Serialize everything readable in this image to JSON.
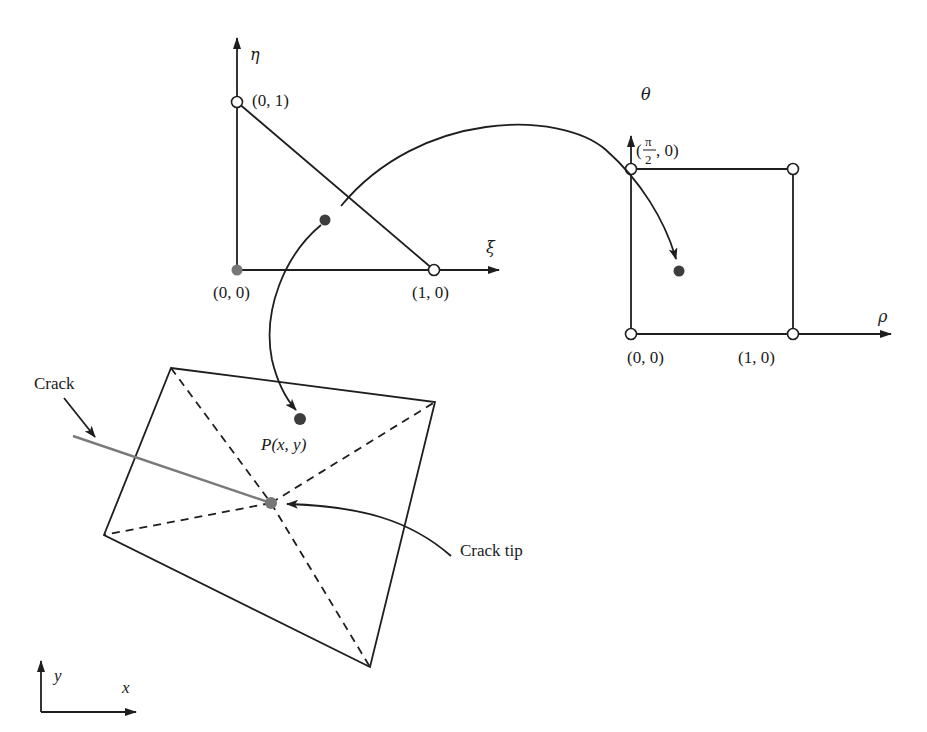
{
  "figure": {
    "type": "isoparametric mapping diagram for crack-tip element",
    "colors": {
      "line": "#1e1e1e",
      "crack": "#7a7a7a",
      "filled_point": "#3d3d3d",
      "crack_tip_point": "#777777",
      "background": "#ffffff"
    }
  },
  "triangle_domain": {
    "axis_vertical_label": "η",
    "axis_horizontal_label": "ξ",
    "vertices": [
      {
        "label": "(0, 0)",
        "style": "filled-gray"
      },
      {
        "label": "(1, 0)",
        "style": "open"
      },
      {
        "label": "(0, 1)",
        "style": "open"
      }
    ]
  },
  "square_domain": {
    "axis_vertical_label": "θ",
    "axis_horizontal_label": "ρ",
    "vertices": [
      {
        "label": "(0, 0)",
        "style": "open"
      },
      {
        "label": "(1, 0)",
        "style": "open"
      },
      {
        "label_prefix": "(",
        "label_frac_num": "π",
        "label_frac_den": "2",
        "label_suffix": ", 0)",
        "style": "open"
      },
      {
        "label": "",
        "style": "open"
      }
    ]
  },
  "physical_element": {
    "point_label": "P(x, y)",
    "crack_label": "Crack",
    "crack_tip_label": "Crack tip",
    "axis_x_label": "x",
    "axis_y_label": "y"
  }
}
